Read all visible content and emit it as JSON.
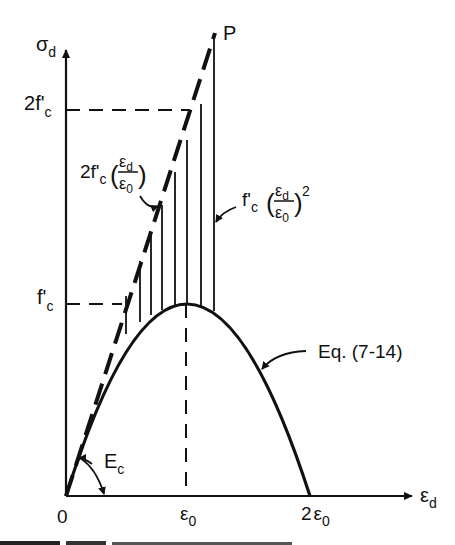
{
  "diagram": {
    "type": "stress-strain diagram",
    "axes": {
      "y_axis_label": "σ",
      "y_axis_sub": "d",
      "x_axis_label": "ε",
      "x_axis_sub": "d",
      "origin_label": "0"
    },
    "x_ticks": [
      {
        "main": "ε",
        "sub": "0",
        "prefix": ""
      },
      {
        "main": "ε",
        "sub": "0",
        "prefix": "2"
      }
    ],
    "y_ticks": [
      {
        "prefix": "2",
        "main": "f'",
        "sub": "c"
      },
      {
        "prefix": "",
        "main": "f'",
        "sub": "c"
      }
    ],
    "point_label": "P",
    "annotations": {
      "linear": {
        "prefix": "2f'",
        "sub": "c",
        "num": "ε",
        "num_sub": "d",
        "den": "ε",
        "den_sub": "0"
      },
      "quadratic": {
        "prefix": "f'",
        "sub": "c",
        "num": "ε",
        "num_sub": "d",
        "den": "ε",
        "den_sub": "0",
        "power": "2"
      },
      "curve_eq": "Eq. (7-14)",
      "modulus": {
        "main": "E",
        "sub": "c"
      }
    },
    "colors": {
      "ink": "#111111",
      "background": "#ffffff"
    }
  }
}
